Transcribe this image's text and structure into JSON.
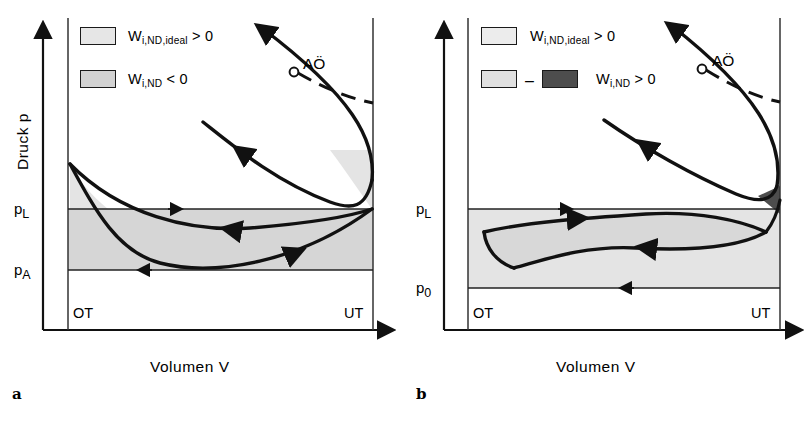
{
  "figure": {
    "type": "p-V diagram pair, gas exchange loop",
    "background_color": "#ffffff",
    "line_color": "#111111",
    "fill_light": "#e2e2e2",
    "fill_mid": "#d0d0d0",
    "fill_dark": "#4a4a4a",
    "caption_partial": ""
  },
  "panels": [
    {
      "id": "a",
      "letter": "a",
      "axes": {
        "y_label": "Druck  p",
        "x_label": "Volumen  V",
        "y_ticks": [
          {
            "key": "pL",
            "text": "p",
            "sub": "L"
          },
          {
            "key": "pA",
            "text": "p",
            "sub": "A"
          }
        ],
        "x_markers": [
          {
            "key": "OT",
            "label": "OT"
          },
          {
            "key": "UT",
            "label": "UT"
          }
        ]
      },
      "legend": [
        {
          "swatch": "light",
          "text": "W",
          "sub": "i,ND,ideal",
          "tail": " > 0",
          "full": "W i,ND,ideal > 0"
        },
        {
          "swatch": "mid",
          "text": "W",
          "sub": "i,ND",
          "tail": " < 0",
          "full": "W i,ND < 0"
        }
      ],
      "annotations": [
        {
          "key": "AO",
          "label": "AÖ",
          "marker": "open-circle"
        }
      ]
    },
    {
      "id": "b",
      "letter": "b",
      "axes": {
        "y_label": "Druck  p",
        "x_label": "Volumen  V",
        "y_ticks": [
          {
            "key": "pL",
            "text": "p",
            "sub": "L"
          },
          {
            "key": "p0",
            "text": "p",
            "sub": "0"
          }
        ],
        "x_markers": [
          {
            "key": "OT",
            "label": "OT"
          },
          {
            "key": "UT",
            "label": "UT"
          }
        ]
      },
      "legend": [
        {
          "swatch": "light",
          "text": "W",
          "sub": "i,ND,ideal",
          "tail": " > 0",
          "full": "W i,ND,ideal > 0"
        },
        {
          "swatch": "light-minus-dark",
          "operator": "–",
          "text": "W",
          "sub": "i,ND",
          "tail": " > 0",
          "full": "W i,ND > 0"
        }
      ],
      "annotations": [
        {
          "key": "AO",
          "label": "AÖ",
          "marker": "open-circle"
        }
      ]
    }
  ]
}
